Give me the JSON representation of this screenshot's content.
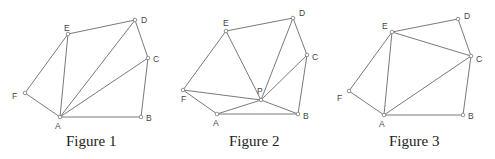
{
  "figures": [
    {
      "caption": "Figure 1",
      "caption_x": 66,
      "vertices": {
        "A": {
          "x": 60,
          "y": 117,
          "label": "A",
          "lx": -5,
          "ly": 12
        },
        "B": {
          "x": 141,
          "y": 117,
          "label": "B",
          "lx": 5,
          "ly": 4
        },
        "C": {
          "x": 148,
          "y": 58,
          "label": "C",
          "lx": 5,
          "ly": 4
        },
        "D": {
          "x": 135,
          "y": 20,
          "label": "D",
          "lx": 6,
          "ly": 3
        },
        "E": {
          "x": 68,
          "y": 34,
          "label": "E",
          "lx": -4,
          "ly": -3
        },
        "F": {
          "x": 25,
          "y": 93,
          "label": "F",
          "lx": -13,
          "ly": 6
        }
      },
      "edges": [
        [
          "A",
          "B"
        ],
        [
          "B",
          "C"
        ],
        [
          "C",
          "D"
        ],
        [
          "D",
          "E"
        ],
        [
          "E",
          "F"
        ],
        [
          "F",
          "A"
        ],
        [
          "A",
          "E"
        ],
        [
          "A",
          "D"
        ],
        [
          "A",
          "C"
        ]
      ]
    },
    {
      "caption": "Figure 2",
      "caption_x": 229,
      "vertices": {
        "A": {
          "x": 217,
          "y": 114,
          "label": "A",
          "lx": -4,
          "ly": 12
        },
        "B": {
          "x": 298,
          "y": 114,
          "label": "B",
          "lx": 5,
          "ly": 5
        },
        "C": {
          "x": 307,
          "y": 55,
          "label": "C",
          "lx": 5,
          "ly": 5
        },
        "D": {
          "x": 293,
          "y": 18,
          "label": "D",
          "lx": 6,
          "ly": -2
        },
        "E": {
          "x": 226,
          "y": 31,
          "label": "E",
          "lx": -3,
          "ly": -5
        },
        "F": {
          "x": 183,
          "y": 90,
          "label": "F",
          "lx": -2,
          "ly": 12
        },
        "P": {
          "x": 261,
          "y": 100,
          "label": "P",
          "lx": -4,
          "ly": -6
        }
      },
      "edges": [
        [
          "A",
          "B"
        ],
        [
          "B",
          "C"
        ],
        [
          "C",
          "D"
        ],
        [
          "D",
          "E"
        ],
        [
          "E",
          "F"
        ],
        [
          "F",
          "A"
        ],
        [
          "P",
          "A"
        ],
        [
          "P",
          "B"
        ],
        [
          "P",
          "C"
        ],
        [
          "P",
          "D"
        ],
        [
          "P",
          "E"
        ],
        [
          "P",
          "F"
        ]
      ]
    },
    {
      "caption": "Figure 3",
      "caption_x": 389,
      "vertices": {
        "A": {
          "x": 384,
          "y": 115,
          "label": "A",
          "lx": -5,
          "ly": 12
        },
        "B": {
          "x": 463,
          "y": 115,
          "label": "B",
          "lx": 5,
          "ly": 4
        },
        "C": {
          "x": 471,
          "y": 56,
          "label": "C",
          "lx": 5,
          "ly": 6
        },
        "D": {
          "x": 458,
          "y": 19,
          "label": "D",
          "lx": 6,
          "ly": 0
        },
        "E": {
          "x": 392,
          "y": 32,
          "label": "E",
          "lx": -10,
          "ly": -3
        },
        "F": {
          "x": 349,
          "y": 91,
          "label": "F",
          "lx": -12,
          "ly": 10
        }
      },
      "edges": [
        [
          "A",
          "B"
        ],
        [
          "B",
          "C"
        ],
        [
          "C",
          "D"
        ],
        [
          "D",
          "E"
        ],
        [
          "E",
          "F"
        ],
        [
          "F",
          "A"
        ],
        [
          "A",
          "E"
        ],
        [
          "A",
          "C"
        ],
        [
          "E",
          "C"
        ]
      ]
    }
  ]
}
